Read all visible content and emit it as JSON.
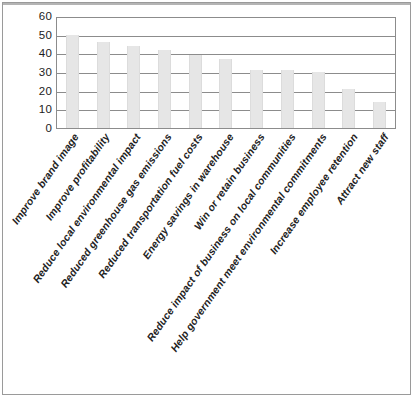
{
  "chart_data": {
    "type": "bar",
    "title": "",
    "subtitle": "",
    "xlabel": "",
    "ylabel": "",
    "ylim": [
      0,
      60
    ],
    "ytick_step": 10,
    "yticks": [
      "60",
      "50",
      "40",
      "30",
      "20",
      "10",
      "0"
    ],
    "grid": true,
    "legend": "none",
    "bar_color": "#e6e6e6",
    "axis_color": "#8c8c8c",
    "categories": [
      "Improve brand image",
      "Improve profitability",
      "Reduce local environmental impact",
      "Reduced greenhouse gas emissions",
      "Reduced transportation fuel costs",
      "Energy savings in warehouse",
      "Win or retain business",
      "Reduce impact of business on local communities",
      "Help government meet environmental commitments",
      "Increase employee retention",
      "Attract new staff"
    ],
    "values": [
      50,
      46,
      44,
      42,
      39,
      37,
      31,
      31,
      30,
      21,
      14
    ]
  }
}
